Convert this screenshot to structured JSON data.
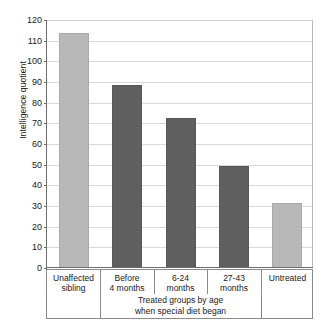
{
  "chart_data": {
    "type": "bar",
    "title": "",
    "subtitle": "",
    "xlabel": "",
    "ylabel": "Intelligence quotient",
    "ylim": [
      0,
      120
    ],
    "ytick_step": 10,
    "yticks": [
      "120",
      "110",
      "100",
      "90",
      "80",
      "70",
      "60",
      "50",
      "40",
      "30",
      "20",
      "10",
      "0"
    ],
    "ytick_values": [
      120,
      110,
      100,
      90,
      80,
      70,
      60,
      50,
      40,
      30,
      20,
      10,
      0
    ],
    "grid": true,
    "legend": "none",
    "categories": [
      "Unaffected sibling",
      "Before 4 months",
      "6-24 months",
      "27-43 months",
      "Untreated"
    ],
    "values": [
      113,
      88,
      72,
      49,
      31
    ],
    "bars": [
      {
        "label_line1": "Unaffected",
        "label_line2": "sibling",
        "value": 113,
        "style": "light"
      },
      {
        "label_line1": "Before",
        "label_line2": "4 months",
        "value": 88,
        "style": "dark"
      },
      {
        "label_line1": "6-24",
        "label_line2": "months",
        "value": 72,
        "style": "dark"
      },
      {
        "label_line1": "27-43",
        "label_line2": "months",
        "value": 49,
        "style": "dark"
      },
      {
        "label_line1": "Untreated",
        "label_line2": "",
        "value": 31,
        "style": "light"
      }
    ],
    "annotations": {
      "group_caption_line1": "Treated groups by age",
      "group_caption_line2": "when special diet began"
    },
    "colors": {
      "bar_light": "#b8b8b8",
      "bar_dark": "#5f5f5f",
      "gridline": "#d9d9d9",
      "axis": "#6e6e6e",
      "text": "#1a1a1a",
      "background": "#ffffff"
    }
  }
}
